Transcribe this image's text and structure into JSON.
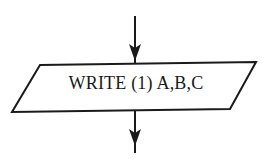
{
  "diagram": {
    "type": "flowchart-fragment",
    "nodes": [
      {
        "id": "write",
        "shape": "parallelogram",
        "label": "WRITE (1) A,B,C"
      }
    ],
    "edges": [
      {
        "from": "previous",
        "to": "write",
        "direction": "down"
      },
      {
        "from": "write",
        "to": "next",
        "direction": "down"
      }
    ],
    "colors": {
      "stroke": "#1a1a1a",
      "background": "#ffffff"
    }
  }
}
